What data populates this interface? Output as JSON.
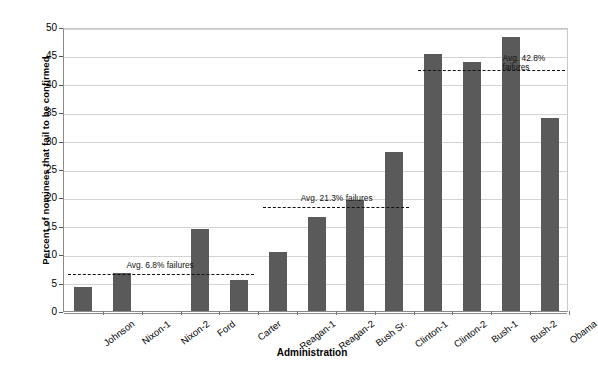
{
  "chart_data": {
    "type": "bar",
    "title": "",
    "xlabel": "Administration",
    "ylabel": "Percent of nominees that fail to be confirmed",
    "ylim": [
      0,
      50
    ],
    "ytick_step": 5,
    "yticks": [
      "50",
      "45",
      "40",
      "35",
      "30",
      "25",
      "20",
      "15",
      "10",
      "5",
      "0"
    ],
    "grid": true,
    "legend": "none",
    "bar_color": "#5a5a5a",
    "categories": [
      "Johnson",
      "Nixon-1",
      "Nixon-2",
      "Ford",
      "Carter",
      "Reagan-1",
      "Reagan-2",
      "Bush Sr.",
      "Clinton-1",
      "Clinton-2",
      "Bush-1",
      "Bush-2",
      "Obama"
    ],
    "values": [
      4.2,
      6.7,
      0,
      14.4,
      5.4,
      10.4,
      16.5,
      19.5,
      28.0,
      45.3,
      43.9,
      48.3,
      33.9
    ],
    "annotations": [
      {
        "label": "Avg. 6.8% failures",
        "value": 6.8,
        "span_categories": [
          "Johnson",
          "Carter"
        ],
        "label_lines": "Avg. 6.8% failures"
      },
      {
        "label": "Avg. 21.3% failures",
        "value": 18.7,
        "span_categories": [
          "Reagan-1",
          "Clinton-1"
        ],
        "label_lines": "Avg. 21.3% failures"
      },
      {
        "label": "Avg. 42.8% failures",
        "value": 42.8,
        "span_categories": [
          "Clinton-2",
          "Obama"
        ],
        "label_lines": "Avg. 42.8%\nfailures"
      }
    ]
  }
}
